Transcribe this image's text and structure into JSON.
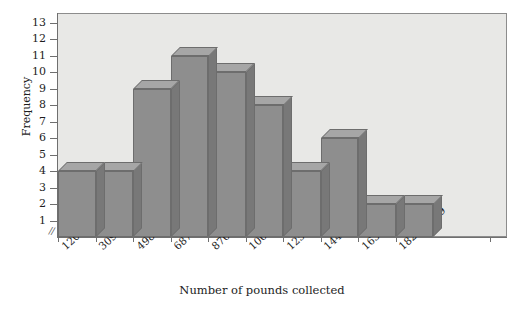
{
  "chart_data": {
    "type": "bar",
    "title": "",
    "subtitle": "",
    "xlabel": "Number of pounds collected",
    "ylabel": "Frequency",
    "categories": [
      "120–308",
      "309–497",
      "498–686",
      "687–875",
      "876–1064",
      "1065–1253",
      "1254–1442",
      "1443–1631",
      "1632–1820",
      "1821–2009"
    ],
    "values": [
      4,
      4,
      9,
      11,
      10,
      8,
      4,
      6,
      2,
      2
    ],
    "ylim": [
      0,
      13.6
    ],
    "ytick_labels": [
      "1",
      "2",
      "3",
      "4",
      "5",
      "6",
      "7",
      "8",
      "9",
      "10",
      "11",
      "12",
      "13"
    ],
    "ytick_values": [
      1,
      2,
      3,
      4,
      5,
      6,
      7,
      8,
      9,
      10,
      11,
      12,
      13
    ],
    "grid": false,
    "legend": false,
    "legend_position": "none",
    "axis_break": "⫻",
    "style": "3d-bars",
    "colors": {
      "bar_face": "#8e8e8e",
      "bar_top": "#a6a6a6",
      "bar_side": "#787878",
      "bar_edge": "#6d6d6d",
      "plot_background": "#e8e8e6",
      "axis": "#6f6f6f",
      "text": "#1d1d1d",
      "figure_background": "#ffffff"
    }
  }
}
